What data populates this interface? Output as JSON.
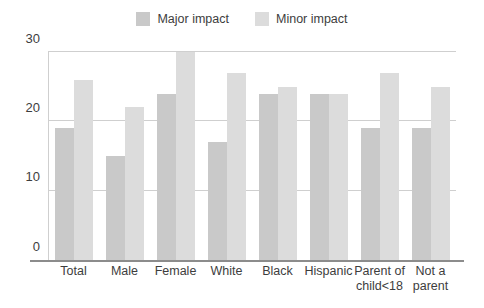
{
  "chart_data": {
    "type": "bar",
    "title": "",
    "subtitle": "",
    "xlabel": "",
    "ylabel": "",
    "ylim": [
      0,
      30
    ],
    "yticks": [
      0,
      10,
      20,
      30
    ],
    "grid": true,
    "legend_position": "top-center",
    "categories": [
      "Total",
      "Male",
      "Female",
      "White",
      "Black",
      "Hispanic",
      "Parent of child<18",
      "Not a parent"
    ],
    "category_lines": [
      [
        "Total"
      ],
      [
        "Male"
      ],
      [
        "Female"
      ],
      [
        "White"
      ],
      [
        "Black"
      ],
      [
        "Hispanic"
      ],
      [
        "Parent of",
        "child<18"
      ],
      [
        "Not a",
        "parent"
      ]
    ],
    "series": [
      {
        "name": "Major impact",
        "color": "#c9c9c9",
        "values": [
          19,
          15,
          24,
          17,
          24,
          24,
          19,
          19
        ]
      },
      {
        "name": "Minor impact",
        "color": "#dcdcdc",
        "values": [
          26,
          22,
          30,
          27,
          25,
          24,
          27,
          25
        ]
      }
    ]
  },
  "axes": {
    "y_tick_labels": [
      "0",
      "10",
      "20",
      "30"
    ]
  },
  "colors": {
    "major_impact": "#c9c9c9",
    "minor_impact": "#dcdcdc",
    "gridline": "#cfcfcf",
    "baseline": "#8c8c8c",
    "text": "#3d3d3d",
    "background": "#ffffff"
  }
}
